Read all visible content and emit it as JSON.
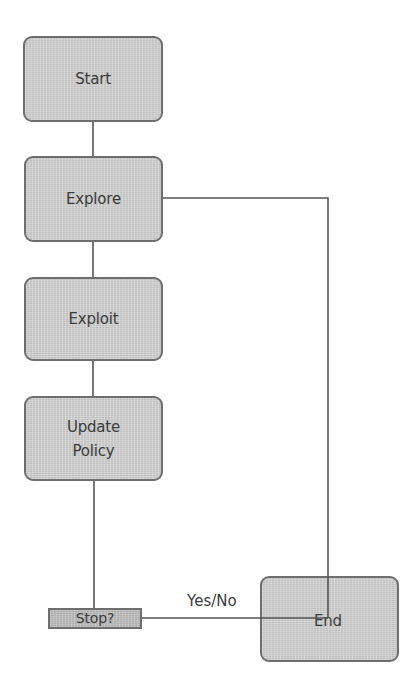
{
  "diagram": {
    "type": "flowchart",
    "nodes": [
      {
        "id": "start",
        "label": "Start"
      },
      {
        "id": "explore",
        "label": "Explore"
      },
      {
        "id": "exploit",
        "label": "Exploit"
      },
      {
        "id": "update_policy",
        "label": "Update\nPolicy"
      },
      {
        "id": "stop",
        "label": "Stop?"
      },
      {
        "id": "end",
        "label": "End"
      }
    ],
    "edges": [
      {
        "from": "start",
        "to": "explore",
        "label": ""
      },
      {
        "from": "explore",
        "to": "exploit",
        "label": ""
      },
      {
        "from": "exploit",
        "to": "update_policy",
        "label": ""
      },
      {
        "from": "update_policy",
        "to": "stop",
        "label": ""
      },
      {
        "from": "stop",
        "to": "end",
        "label": "Yes/No"
      },
      {
        "from": "explore",
        "to": "end",
        "label": ""
      }
    ],
    "edge_labels": {
      "stop_to_end": "Yes/No"
    },
    "colors": {
      "node_fill": "#d3d3d3",
      "node_border": "#6e6e6e",
      "stop_fill": "#bfbfbf",
      "line": "#555555",
      "text": "#3c3c3c",
      "background": "#ffffff"
    }
  }
}
